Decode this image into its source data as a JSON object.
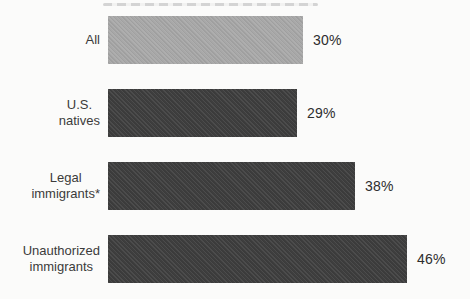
{
  "chart_data": {
    "type": "bar",
    "orientation": "horizontal",
    "title": "",
    "categories": [
      "All",
      "U.S. natives",
      "Legal immigrants*",
      "Unauthorized immigrants"
    ],
    "values": [
      30,
      29,
      38,
      46
    ],
    "value_labels": [
      "30%",
      "29%",
      "38%",
      "46%"
    ],
    "xlim": [
      0,
      50
    ],
    "grid": false,
    "legend": "none",
    "px_per_percent": 6.5,
    "colors": {
      "highlight_bar": "#a8a8a8",
      "default_bar": "#3e3e3e",
      "text": "#3b3b3b",
      "background": "#fbfbfa"
    },
    "rows": [
      {
        "label_lines": [
          "All"
        ],
        "value": 30,
        "value_label": "30%",
        "color": "#a8a8a8"
      },
      {
        "label_lines": [
          "U.S.",
          "natives"
        ],
        "value": 29,
        "value_label": "29%",
        "color": "#3e3e3e"
      },
      {
        "label_lines": [
          "Legal",
          "immigrants*"
        ],
        "value": 38,
        "value_label": "38%",
        "color": "#3e3e3e"
      },
      {
        "label_lines": [
          "Unauthorized",
          "immigrants"
        ],
        "value": 46,
        "value_label": "46%",
        "color": "#3e3e3e"
      }
    ]
  }
}
